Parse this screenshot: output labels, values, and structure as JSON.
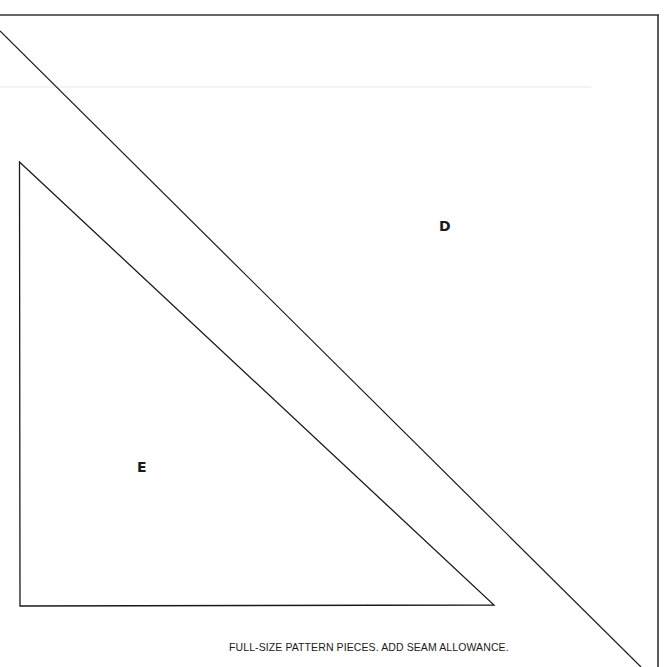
{
  "document": {
    "type": "quilt pattern sheet",
    "pieces": [
      {
        "id": "D",
        "label": "D",
        "shape": "triangle"
      },
      {
        "id": "E",
        "label": "E",
        "shape": "triangle"
      }
    ],
    "caption": "FULL-SIZE PATTERN PIECES. ADD SEAM ALLOWANCE.",
    "colors": {
      "line": "#1a1a1a",
      "background": "#ffffff"
    }
  }
}
